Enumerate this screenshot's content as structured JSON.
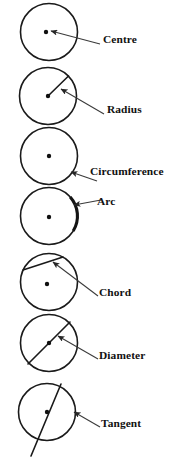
{
  "figure": {
    "background_color": "#ffffff",
    "stroke_color": "#1a1a1a",
    "label_color": "#111111",
    "leader_color": "#3a3a3a",
    "width": 188,
    "height": 475
  },
  "items": [
    {
      "id": "centre",
      "label": "Centre",
      "feature": "center-point",
      "circle": {
        "cx": 49,
        "cy": 32,
        "r": 28.5
      },
      "marker": {
        "type": "dot",
        "x": 46,
        "y": 32,
        "r": 2.2
      },
      "leader": {
        "x1": 100,
        "y1": 44,
        "x2": 51,
        "y2": 31
      },
      "label_pos": {
        "x": 103,
        "y": 43
      }
    },
    {
      "id": "radius",
      "label": "Radius",
      "feature": "radius-segment",
      "circle": {
        "cx": 48,
        "cy": 96,
        "r": 28.5
      },
      "marker": {
        "type": "dot",
        "x": 48,
        "y": 96,
        "r": 2.2
      },
      "segment": {
        "x1": 48,
        "y1": 96,
        "x2": 68.5,
        "y2": 76
      },
      "leader": {
        "x1": 104,
        "y1": 114,
        "x2": 61,
        "y2": 89
      },
      "label_pos": {
        "x": 107,
        "y": 113
      }
    },
    {
      "id": "circumference",
      "label": "Circumference",
      "feature": "boundary-curve",
      "circle": {
        "cx": 49,
        "cy": 156,
        "r": 28.5
      },
      "marker": {
        "type": "dot",
        "x": 49,
        "y": 156,
        "r": 2.2
      },
      "leader": {
        "x1": 97,
        "y1": 181,
        "x2": 71,
        "y2": 172
      },
      "label_pos": {
        "x": 90,
        "y": 175
      }
    },
    {
      "id": "arc",
      "label": "Arc",
      "feature": "arc-segment",
      "circle": {
        "cx": 49,
        "cy": 216,
        "r": 28.5
      },
      "marker": {
        "type": "dot",
        "x": 49,
        "y": 217,
        "r": 2.2
      },
      "arc": {
        "start_angle": -42,
        "end_angle": 32
      },
      "leader": {
        "x1": 101,
        "y1": 200,
        "x2": 74,
        "y2": 205
      },
      "label_pos": {
        "x": 97,
        "y": 205
      }
    },
    {
      "id": "chord",
      "label": "Chord",
      "feature": "chord-segment",
      "circle": {
        "cx": 49,
        "cy": 282,
        "r": 28.5
      },
      "marker": {
        "type": "dot",
        "x": 47,
        "y": 284,
        "r": 2.2
      },
      "segment": {
        "x1": 24,
        "y1": 270,
        "x2": 62,
        "y2": 257
      },
      "leader": {
        "x1": 98,
        "y1": 296,
        "x2": 53,
        "y2": 262
      },
      "label_pos": {
        "x": 99,
        "y": 296
      }
    },
    {
      "id": "diameter",
      "label": "Diameter",
      "feature": "diameter-segment",
      "circle": {
        "cx": 49,
        "cy": 343,
        "r": 28.5
      },
      "marker": {
        "type": "dot",
        "x": 49,
        "y": 343,
        "r": 2.2
      },
      "segment": {
        "x1": 28,
        "y1": 364,
        "x2": 70,
        "y2": 322
      },
      "leader": {
        "x1": 98,
        "y1": 359,
        "x2": 58,
        "y2": 336
      },
      "label_pos": {
        "x": 99,
        "y": 359
      }
    },
    {
      "id": "tangent",
      "label": "Tangent",
      "feature": "tangent-line",
      "circle": {
        "cx": 47,
        "cy": 412,
        "r": 28.5
      },
      "marker": {
        "type": "dot",
        "x": 47,
        "y": 412,
        "r": 2.2
      },
      "segment": {
        "x1": 59,
        "y1": 385,
        "x2": 32,
        "y2": 455
      },
      "leader": {
        "x1": 100,
        "y1": 427,
        "x2": 75,
        "y2": 412
      },
      "label_pos": {
        "x": 101,
        "y": 427
      }
    }
  ]
}
